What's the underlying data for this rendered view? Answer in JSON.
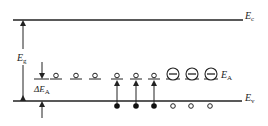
{
  "diagram": {
    "labels": {
      "conduction_band": {
        "main": "E",
        "sub": "c"
      },
      "valence_band": {
        "main": "E",
        "sub": "v"
      },
      "band_gap": {
        "main": "E",
        "sub": "g"
      },
      "acceptor_level": {
        "main": "E",
        "sub": "A"
      },
      "ionization_energy": {
        "main": "ΔE",
        "sub": "A"
      }
    },
    "neutral_acceptors_count": 6,
    "ionized_acceptors_count": 3,
    "electrons_count": 3,
    "holes_count": 3
  }
}
